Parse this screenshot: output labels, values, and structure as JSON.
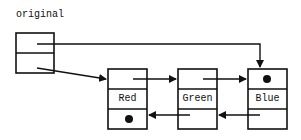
{
  "diagram": {
    "title": "original",
    "header": {
      "cells": [
        "first",
        "last"
      ]
    },
    "nodes": [
      {
        "name": "red",
        "label": "Red",
        "prev": "null",
        "next": "Green"
      },
      {
        "name": "green",
        "label": "Green",
        "prev": "Red",
        "next": "Blue"
      },
      {
        "name": "blue",
        "label": "Blue",
        "prev": "Green",
        "next": "null"
      }
    ],
    "colors": {
      "stroke": "#111111",
      "background": "#ffffff"
    }
  }
}
